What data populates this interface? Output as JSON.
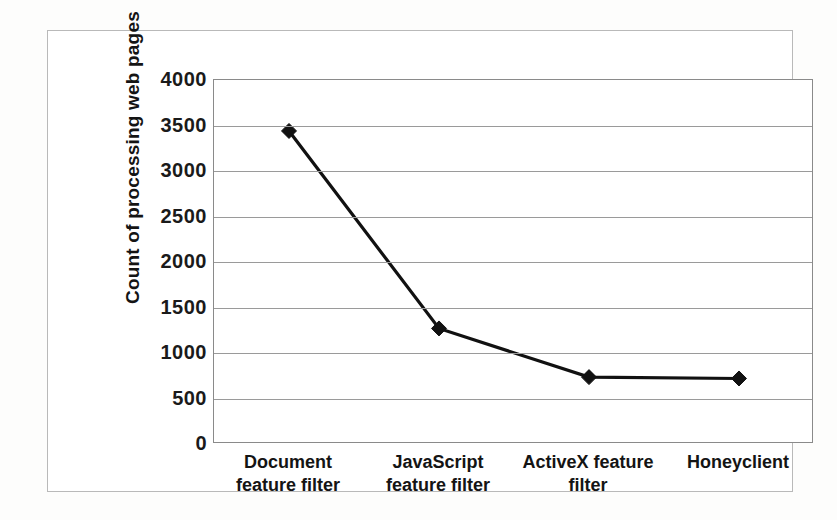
{
  "figure": {
    "frame_color": "#b9b9b9",
    "plot_background": "#ffffff",
    "series_color": "#111111"
  },
  "axis": {
    "y_title": "Count of processing web pages",
    "y_ticks": [
      "4000",
      "3500",
      "3000",
      "2500",
      "2000",
      "1500",
      "1000",
      "500",
      "0"
    ],
    "x_ticks": [
      "Document feature filter",
      "JavaScript feature filter",
      "ActiveX feature filter",
      "Honeyclient"
    ]
  },
  "chart_data": {
    "type": "line",
    "title": "",
    "subtitle": "",
    "xlabel": "",
    "ylabel": "Count of processing web pages",
    "categories": [
      "Document feature filter",
      "JavaScript feature filter",
      "ActiveX feature filter",
      "Honeyclient"
    ],
    "values": [
      3440,
      1270,
      735,
      720
    ],
    "series": [
      {
        "name": "Count of processing web pages",
        "values": [
          3440,
          1270,
          735,
          720
        ],
        "color": "#111111",
        "marker": "diamond"
      }
    ],
    "ylim": [
      0,
      4000
    ],
    "ytick_values": [
      0,
      500,
      1000,
      1500,
      2000,
      2500,
      3000,
      3500,
      4000
    ],
    "grid": true,
    "grid_axis": "y",
    "legend": false,
    "legend_position": "none"
  }
}
